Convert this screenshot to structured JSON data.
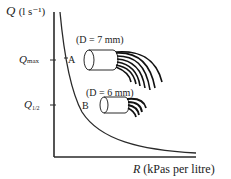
{
  "figure": {
    "y_axis_label": {
      "symbol": "Q",
      "unit": "(l s⁻¹)"
    },
    "x_axis_label": {
      "symbol": "R",
      "unit": "(kPas per litre)"
    },
    "ticks": [
      {
        "id": "qmax",
        "symbol": "Q",
        "subscript": "max"
      },
      {
        "id": "qhalf",
        "symbol": "Q",
        "subscript": "1/2"
      }
    ],
    "points": [
      {
        "id": "A",
        "label": "A"
      },
      {
        "id": "B",
        "label": "B"
      }
    ],
    "nozzles": [
      {
        "id": "nozzle-7mm",
        "label": "(D = 7 mm)",
        "diameter_symbol": "D",
        "diameter": "7 mm"
      },
      {
        "id": "nozzle-6mm",
        "label": "(D = 6 mm)",
        "diameter_symbol": "D",
        "diameter": "6 mm"
      }
    ],
    "colors": {
      "line": "#2a2a2a",
      "background": "#ffffff"
    }
  }
}
